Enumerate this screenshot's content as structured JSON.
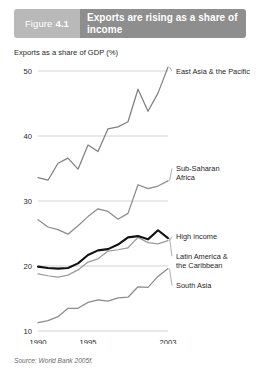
{
  "figure": {
    "number_word": "Figure",
    "number": "4.1",
    "title": "Exports are rising as a share of income",
    "source": "Source: World Bank 2005f."
  },
  "chart_data": {
    "type": "line",
    "title": "Exports are rising as a share of income",
    "xlabel": "",
    "ylabel": "Exports as a share of GDP (%)",
    "axis_title": "Exports as a share of GDP (%)",
    "xlim": [
      1990,
      2003
    ],
    "ylim": [
      10,
      52
    ],
    "yticks": [
      50,
      40,
      30,
      20,
      10
    ],
    "ytick_labels": [
      "50",
      "40",
      "30",
      "20",
      "10"
    ],
    "xticks": [
      1990,
      1995,
      2003
    ],
    "xtick_labels": [
      "1990",
      "1995",
      "2003"
    ],
    "grid": "horizontal",
    "legend_position": "right-inline-labels",
    "x": [
      1990,
      1991,
      1992,
      1993,
      1994,
      1995,
      1996,
      1997,
      1998,
      1999,
      2000,
      2001,
      2002,
      2003
    ],
    "series": [
      {
        "name": "East Asia & the Pacific",
        "color": "#808080",
        "label_x": 2003,
        "label_y": 50,
        "values": [
          33.6,
          33.2,
          35.8,
          36.6,
          34.9,
          38.6,
          37.6,
          41.1,
          41.4,
          42.2,
          47.2,
          43.8,
          46.6,
          50.6
        ]
      },
      {
        "name": "Sub-Saharan Africa",
        "color": "#8c8c8c",
        "label_x": 2003,
        "label_y": 35,
        "values": [
          27.1,
          26.0,
          25.6,
          24.9,
          26.2,
          27.6,
          28.8,
          28.4,
          27.2,
          28.1,
          32.5,
          31.9,
          32.3,
          33.1
        ]
      },
      {
        "name": "High income",
        "color": "#9a9a9a",
        "label_x": 2003,
        "label_y": 24.5,
        "values": [
          18.8,
          18.5,
          18.3,
          18.6,
          19.4,
          20.6,
          21.1,
          22.3,
          22.5,
          22.8,
          24.4,
          23.6,
          23.4,
          23.9
        ]
      },
      {
        "name": "Latin America & the Caribbean",
        "color": "#111111",
        "label_x": 2003,
        "label_y": 21.5,
        "values": [
          19.9,
          19.7,
          19.6,
          19.7,
          20.4,
          21.7,
          22.4,
          22.6,
          23.3,
          24.4,
          24.6,
          24.1,
          25.5,
          24.3
        ]
      },
      {
        "name": "South Asia",
        "color": "#8c8c8c",
        "label_x": 2003,
        "label_y": 17,
        "values": [
          11.3,
          11.6,
          12.2,
          13.5,
          13.5,
          14.4,
          14.8,
          14.6,
          15.1,
          15.2,
          16.8,
          16.7,
          18.4,
          19.6
        ]
      }
    ],
    "series_labels": [
      "East Asia & the Pacific",
      "Sub-Saharan Africa",
      "High income",
      "Latin America & the Caribbean",
      "South Asia"
    ]
  }
}
